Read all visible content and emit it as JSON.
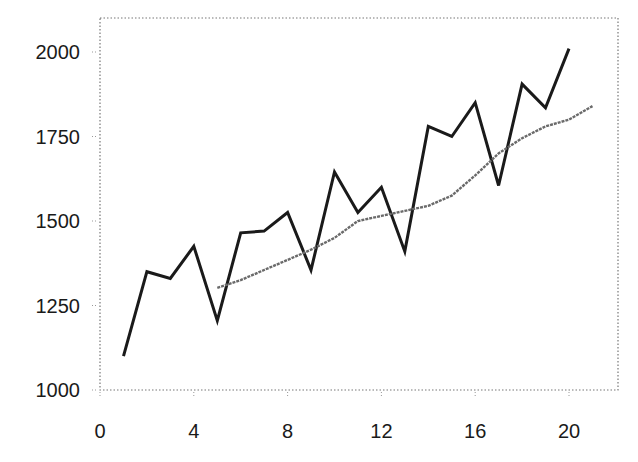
{
  "chart_data": {
    "type": "line",
    "title": "",
    "xlabel": "",
    "ylabel": "",
    "xlim": [
      0,
      22
    ],
    "ylim": [
      1000,
      2100
    ],
    "x_ticks": [
      0,
      4,
      8,
      12,
      16,
      20
    ],
    "y_ticks": [
      1000,
      1250,
      1500,
      1750,
      2000
    ],
    "x_tick_labels": [
      "0",
      "4",
      "8",
      "12",
      "16",
      "20"
    ],
    "y_tick_labels": [
      "1000",
      "1250",
      "1500",
      "1750",
      "2000"
    ],
    "grid": false,
    "legend": null,
    "frame": "dotted",
    "series": [
      {
        "name": "observed",
        "style": "solid",
        "color": "#1a1a1a",
        "x": [
          1,
          2,
          3,
          4,
          5,
          6,
          7,
          8,
          9,
          10,
          11,
          12,
          13,
          14,
          15,
          16,
          17,
          18,
          19,
          20
        ],
        "values": [
          1100,
          1350,
          1330,
          1425,
          1205,
          1465,
          1470,
          1525,
          1355,
          1645,
          1525,
          1600,
          1410,
          1780,
          1750,
          1850,
          1605,
          1905,
          1835,
          2010
        ]
      },
      {
        "name": "trend (moving average)",
        "style": "solid-grainy",
        "color": "#6a6a6a",
        "x": [
          5,
          6,
          7,
          8,
          9,
          10,
          11,
          12,
          13,
          14,
          15,
          16,
          17,
          18,
          19,
          20,
          21
        ],
        "values": [
          1302,
          1325,
          1355,
          1385,
          1415,
          1450,
          1500,
          1515,
          1530,
          1545,
          1575,
          1635,
          1700,
          1745,
          1780,
          1800,
          1840
        ]
      }
    ]
  }
}
